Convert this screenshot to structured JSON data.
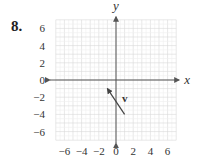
{
  "problem": {
    "number": "8."
  },
  "chart_data": {
    "type": "vector-plot",
    "title": "",
    "xlabel": "x",
    "ylabel": "y",
    "xlim": [
      -7,
      7
    ],
    "ylim": [
      -7,
      7
    ],
    "grid": true,
    "grid_step": 1,
    "x_ticks": [
      -6,
      -4,
      -2,
      0,
      2,
      4,
      6
    ],
    "x_tick_labels": [
      "−6",
      "−4",
      "−2",
      "0",
      "2",
      "4",
      "6"
    ],
    "y_ticks": [
      6,
      4,
      2,
      0,
      -2,
      -4,
      -6
    ],
    "y_tick_labels": [
      "6",
      "4",
      "2",
      "0",
      "−2",
      "−4",
      "−6"
    ],
    "vectors": [
      {
        "name": "v",
        "label": "v",
        "tail": [
          1,
          -4
        ],
        "head": [
          -1,
          -1
        ],
        "components": [
          -2,
          3
        ]
      }
    ],
    "colors": {
      "grid": "#d9d9d9",
      "axis": "#555555",
      "vector": "#444444"
    }
  }
}
